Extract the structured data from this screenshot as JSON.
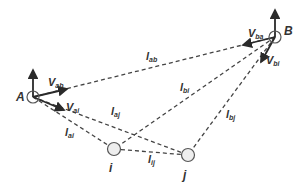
{
  "diagram": {
    "colors": {
      "line": "#444444",
      "arrow": "#2a2a2a",
      "node_fill": "#eeeeee",
      "node_stroke": "#555555",
      "text": "#333333"
    },
    "nodes": [
      {
        "id": "A",
        "label": "A",
        "x": 33,
        "y": 97
      },
      {
        "id": "B",
        "label": "B",
        "x": 275,
        "y": 37
      },
      {
        "id": "i",
        "label": "i",
        "x": 114,
        "y": 149
      },
      {
        "id": "j",
        "label": "j",
        "x": 188,
        "y": 155
      }
    ],
    "edges": [
      {
        "from": "A",
        "to": "B",
        "label_main": "l",
        "label_sub": "ab"
      },
      {
        "from": "A",
        "to": "j",
        "label_main": "l",
        "label_sub": "aj"
      },
      {
        "from": "A",
        "to": "i",
        "label_main": "l",
        "label_sub": "ai"
      },
      {
        "from": "B",
        "to": "i",
        "label_main": "l",
        "label_sub": "bi"
      },
      {
        "from": "B",
        "to": "j",
        "label_main": "l",
        "label_sub": "bj"
      },
      {
        "from": "i",
        "to": "j",
        "label_main": "l",
        "label_sub": "ij"
      }
    ],
    "vectors": [
      {
        "at": "A",
        "label_main": "V",
        "label_sub": "ab"
      },
      {
        "at": "A",
        "label_main": "V",
        "label_sub": "ai"
      },
      {
        "at": "B",
        "label_main": "V",
        "label_sub": "ba"
      },
      {
        "at": "B",
        "label_main": "V",
        "label_sub": "bi"
      }
    ]
  }
}
